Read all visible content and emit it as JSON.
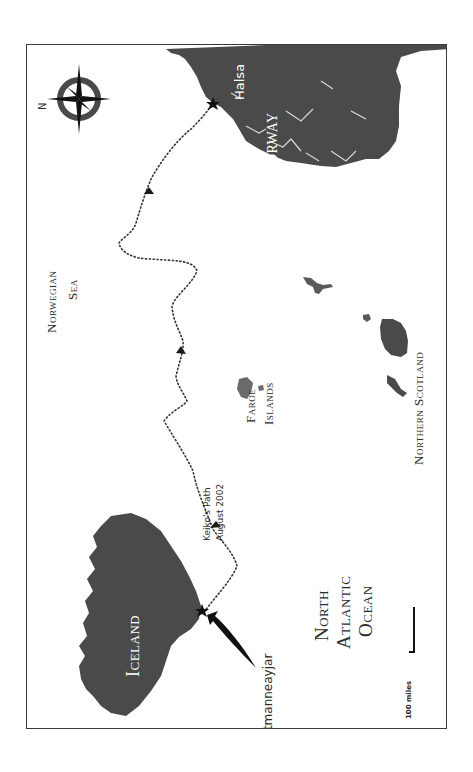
{
  "map": {
    "title": "Keiko's Path Map",
    "orientation": "rotated 90° counter-clockwise; north points left",
    "colors": {
      "land": "#4a4a4a",
      "water": "#ffffff",
      "frame": "#3a3a3a",
      "path": "#333333",
      "label_on_land": "#ffffff",
      "label_on_water": "#2b2b2b"
    },
    "compass": {
      "north_label": "N",
      "icon": "compass-rose-icon"
    },
    "regions": {
      "norway": "Norway",
      "iceland": "Iceland",
      "faroe_line1": "Faroe",
      "faroe_line2": "Islands",
      "scotland": "Northern Scotland",
      "sea_line1": "Norwegian",
      "sea_line2": "Sea",
      "ocean_line1": "North",
      "ocean_line2": "Atlantic",
      "ocean_line3": "Ocean"
    },
    "places": {
      "start": "Vestmanneayjar",
      "end": "Halsa"
    },
    "path": {
      "label_line1": "Keiko's Path",
      "label_line2": "August 2002",
      "style": "dotted",
      "direction_arrows": 4
    },
    "scale": {
      "label": "100 miles"
    }
  }
}
